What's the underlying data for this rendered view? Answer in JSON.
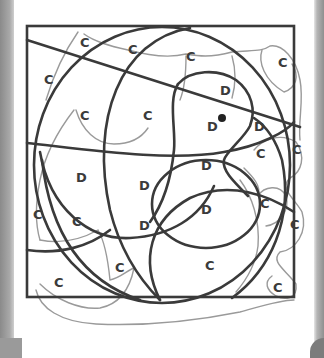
{
  "colors": {
    "background": "#ffffff",
    "frame": "#3a3a3a",
    "region_lines": "#3a3a3a",
    "scribble": "#9a9a9a",
    "label": "#3b3b3b"
  },
  "labels": [
    {
      "text": "C",
      "x": 80,
      "y": 47
    },
    {
      "text": "C",
      "x": 128,
      "y": 54
    },
    {
      "text": "C",
      "x": 186,
      "y": 61
    },
    {
      "text": "C",
      "x": 278,
      "y": 67
    },
    {
      "text": "C",
      "x": 44,
      "y": 84
    },
    {
      "text": "C",
      "x": 80,
      "y": 120
    },
    {
      "text": "C",
      "x": 143,
      "y": 120
    },
    {
      "text": "D",
      "x": 220,
      "y": 95
    },
    {
      "text": "D",
      "x": 210,
      "y": 129
    },
    {
      "text": "D",
      "x": 258,
      "y": 129
    },
    {
      "text": "C",
      "x": 260,
      "y": 158
    },
    {
      "text": "C",
      "x": 296,
      "y": 154
    },
    {
      "text": "D",
      "x": 80,
      "y": 180
    },
    {
      "text": "D",
      "x": 143,
      "y": 188
    },
    {
      "text": "D",
      "x": 205,
      "y": 168
    },
    {
      "text": "D",
      "x": 205,
      "y": 212
    },
    {
      "text": "C",
      "x": 37,
      "y": 217
    },
    {
      "text": "C",
      "x": 76,
      "y": 224
    },
    {
      "text": "D",
      "x": 143,
      "y": 228
    },
    {
      "text": "C",
      "x": 264,
      "y": 206
    },
    {
      "text": "C",
      "x": 294,
      "y": 227
    },
    {
      "text": "C",
      "x": 119,
      "y": 270
    },
    {
      "text": "C",
      "x": 209,
      "y": 268
    },
    {
      "text": "C",
      "x": 58,
      "y": 285
    },
    {
      "text": "C",
      "x": 277,
      "y": 290
    }
  ],
  "marker": {
    "name": "dot",
    "x": 222,
    "y": 118
  }
}
